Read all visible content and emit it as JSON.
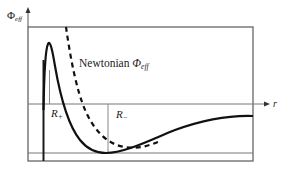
{
  "figure": {
    "type": "effective potential diagram",
    "y_axis_label": {
      "symbol": "Φ",
      "subscript": "eff"
    },
    "x_axis_label": "r",
    "curve_label": {
      "prefix": "Newtonian ",
      "symbol": "Φ",
      "subscript": "eff"
    },
    "markers": [
      {
        "id": "R_plus",
        "symbol": "R",
        "subscript": "+"
      },
      {
        "id": "R_minus",
        "symbol": "R",
        "subscript": "−"
      }
    ],
    "curves": [
      {
        "name": "relativistic Φ_eff",
        "style": "solid",
        "color": "#111111"
      },
      {
        "name": "Newtonian Φ_eff",
        "style": "dashed",
        "color": "#111111"
      }
    ],
    "colors": {
      "frame": "#555555",
      "guides": "#888888",
      "curve": "#111111"
    }
  }
}
